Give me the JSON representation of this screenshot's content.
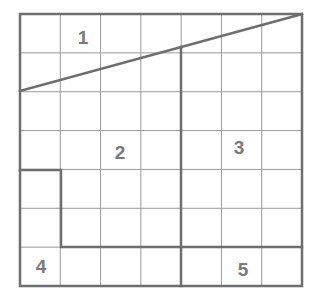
{
  "diagram": {
    "type": "grid-partition",
    "grid": {
      "columns": 7,
      "rows": 7,
      "left": 20,
      "top": 14,
      "right": 302,
      "bottom": 286
    },
    "colors": {
      "grid_line": "#8a8a8a",
      "boundary_line": "#6e6e6e",
      "label": "#7a7a7a",
      "background": "#ffffff"
    },
    "regions": [
      {
        "id": "1",
        "label": "1",
        "x": 83,
        "y": 44
      },
      {
        "id": "2",
        "label": "2",
        "x": 120,
        "y": 159
      },
      {
        "id": "3",
        "label": "3",
        "x": 239,
        "y": 154
      },
      {
        "id": "4",
        "label": "4",
        "x": 41,
        "y": 273
      },
      {
        "id": "5",
        "label": "5",
        "x": 243,
        "y": 276
      }
    ]
  }
}
